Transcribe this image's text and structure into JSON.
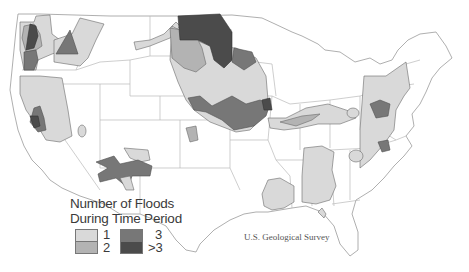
{
  "map": {
    "title": "Number of Floods During Time Period",
    "region": "Conterminous United States",
    "credit": "U.S. Geological Survey",
    "colors": {
      "level_1": "#d9d9d9",
      "level_2": "#b3b3b3",
      "level_3": "#777777",
      "level_gt3": "#4b4b4b",
      "state_border": "#b9b9b9",
      "background": "#ffffff"
    }
  },
  "legend": {
    "title_line1": "Number of Floods",
    "title_line2": "During Time Period",
    "items": [
      {
        "label": "1",
        "color": "#d9d9d9"
      },
      {
        "label": "2",
        "color": "#b3b3b3"
      },
      {
        "label": "3",
        "color": "#777777"
      },
      {
        "label": ">3",
        "color": "#4b4b4b"
      }
    ]
  }
}
